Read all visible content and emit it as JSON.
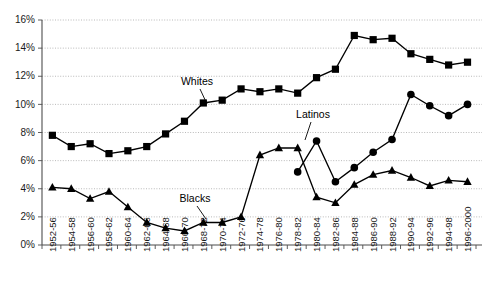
{
  "chart_data": {
    "type": "line",
    "title": "",
    "subtitle": "",
    "xlabel": "",
    "ylabel": "",
    "ylim": [
      0,
      16
    ],
    "ytick_labels": [
      "0%",
      "2%",
      "4%",
      "6%",
      "8%",
      "10%",
      "12%",
      "14%",
      "16%"
    ],
    "ytick_values": [
      0,
      2,
      4,
      6,
      8,
      10,
      12,
      14,
      16
    ],
    "grid": true,
    "legend_position": "inline-annotations",
    "categories": [
      "1952-56",
      "1954-58",
      "1956-60",
      "1958-62",
      "1960-64",
      "1962-66",
      "1964-68",
      "1966-70",
      "1968-72",
      "1970-74",
      "1972-76",
      "1974-78",
      "1976-80",
      "1978-82",
      "1980-84",
      "1982-86",
      "1984-88",
      "1986-90",
      "1988-92",
      "1990-94",
      "1992-96",
      "1994-98",
      "1996-2000"
    ],
    "series": [
      {
        "name": "Whites",
        "marker": "square",
        "values": [
          7.8,
          7.0,
          7.2,
          6.5,
          6.7,
          7.0,
          7.9,
          8.8,
          10.1,
          10.3,
          11.1,
          10.9,
          11.1,
          10.8,
          11.9,
          12.5,
          14.9,
          14.6,
          14.7,
          13.6,
          13.2,
          12.8,
          13.0
        ]
      },
      {
        "name": "Blacks",
        "marker": "triangle",
        "values": [
          4.1,
          4.0,
          3.3,
          3.8,
          2.7,
          1.6,
          1.2,
          1.0,
          1.6,
          1.6,
          2.0,
          6.4,
          6.9,
          6.9,
          3.4,
          3.0,
          4.3,
          5.0,
          5.3,
          4.8,
          4.2,
          4.6,
          4.5
        ]
      },
      {
        "name": "Latinos",
        "marker": "circle",
        "values": [
          null,
          null,
          null,
          null,
          null,
          null,
          null,
          null,
          null,
          null,
          null,
          null,
          null,
          5.2,
          7.4,
          4.5,
          5.5,
          6.6,
          7.5,
          10.7,
          9.9,
          9.2,
          10.0
        ]
      }
    ],
    "annotations": [
      {
        "label": "Whites",
        "text_x": 197,
        "text_y": 85,
        "leader_x1": 200,
        "leader_y1": 89,
        "leader_x2": 207,
        "leader_y2": 104
      },
      {
        "label": "Blacks",
        "text_x": 195,
        "text_y": 202,
        "leader_x1": 197,
        "leader_y1": 206,
        "leader_x2": 206,
        "leader_y2": 219
      },
      {
        "label": "Latinos",
        "text_x": 313,
        "text_y": 118,
        "leader_x1": 311,
        "leader_y1": 122,
        "leader_x2": 305,
        "leader_y2": 140
      }
    ],
    "colors": {
      "series": "#000000",
      "grid": "#8c8c8c",
      "axis": "#4d4d4d",
      "text": "#1a1a1a",
      "background": "#ffffff"
    }
  }
}
